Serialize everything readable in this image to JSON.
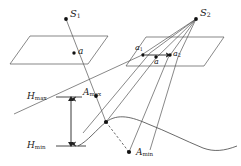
{
  "figure": {
    "stroke_color": "#333333",
    "background_color": "#ffffff"
  },
  "labels": {
    "source_1": "S",
    "source_1_sub": "1",
    "source_2": "S",
    "source_2_sub": "2",
    "point_a": "a",
    "point_a1": "a",
    "point_a1_sub": "1",
    "point_a2": "a",
    "point_a2_sub": "2",
    "point_a_right": "a",
    "h_max": "H",
    "h_max_sub": "max",
    "h_min": "H",
    "h_min_sub": "min",
    "a_max": "A",
    "a_max_sub": "max",
    "a_min": "A",
    "a_min_sub": "min"
  },
  "geometry": {
    "plane_left": "left parallelogram footprint",
    "plane_right": "right parallelogram footprint",
    "terrain_curve": "undulating ground profile",
    "height_span_arrow": "double-headed vertical arrow between H_max and H_min",
    "a1_a2_arrow": "horizontal arrow from a1 to a2"
  }
}
